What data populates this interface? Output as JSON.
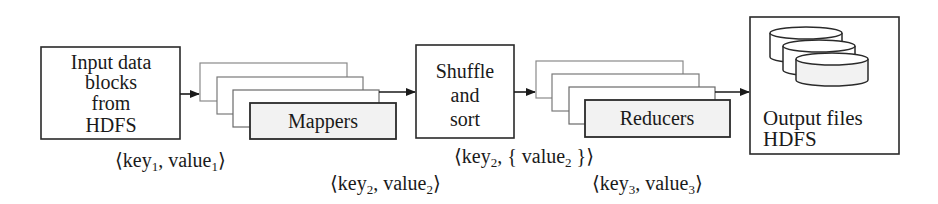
{
  "diagram": {
    "nodes": {
      "input": {
        "lines": [
          "Input data",
          "blocks",
          "from",
          "HDFS"
        ]
      },
      "mappers": {
        "label": "Mappers"
      },
      "shuffle": {
        "lines": [
          "Shuffle",
          "and",
          "sort"
        ]
      },
      "reducers": {
        "label": "Reducers"
      },
      "output": {
        "lines": [
          "Output files",
          "HDFS"
        ],
        "icon": "database-stack-icon"
      }
    },
    "edges": [
      {
        "from": "input",
        "to": "mappers"
      },
      {
        "from": "mappers",
        "to": "shuffle"
      },
      {
        "from": "shuffle",
        "to": "reducers"
      },
      {
        "from": "reducers",
        "to": "output"
      }
    ],
    "pair_labels": {
      "input_pairs": {
        "open": "⟨key",
        "sub1": "1",
        "mid": ", value",
        "sub2": "1",
        "close": "⟩"
      },
      "mapper_pairs": {
        "open": "⟨key",
        "sub1": "2",
        "mid": ", value",
        "sub2": "2",
        "close": "⟩"
      },
      "shuffle_pairs": {
        "open": "⟨key",
        "sub1": "2",
        "mid": ", { value",
        "sub2": "2",
        "close": " }⟩"
      },
      "reducer_pairs": {
        "open": "⟨key",
        "sub1": "3",
        "mid": ", value",
        "sub2": "3",
        "close": "⟩"
      }
    },
    "colors": {
      "stroke": "#2a2a2a",
      "fill": "#ffffff",
      "front_fill": "#f2f2f2",
      "back_stroke": "#8a8a8a"
    }
  }
}
